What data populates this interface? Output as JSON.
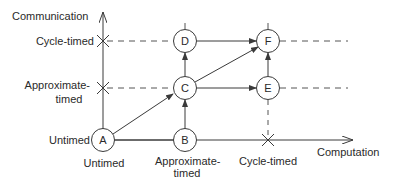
{
  "diagram": {
    "y_axis_label": "Communication",
    "x_axis_label": "Computation",
    "y_levels": [
      {
        "id": "untimed",
        "label": "Untimed"
      },
      {
        "id": "approximate",
        "label_line1": "Approximate-",
        "label_line2": "timed"
      },
      {
        "id": "cycle",
        "label": "Cycle-timed"
      }
    ],
    "x_levels": [
      {
        "id": "untimed",
        "label": "Untimed"
      },
      {
        "id": "approximate",
        "label_line1": "Approximate-",
        "label_line2": "timed"
      },
      {
        "id": "cycle",
        "label": "Cycle-timed"
      }
    ],
    "nodes": [
      {
        "id": "A",
        "label": "A",
        "computation": "Untimed",
        "communication": "Untimed"
      },
      {
        "id": "B",
        "label": "B",
        "computation": "Approximate-timed",
        "communication": "Untimed"
      },
      {
        "id": "C",
        "label": "C",
        "computation": "Approximate-timed",
        "communication": "Approximate-timed"
      },
      {
        "id": "D",
        "label": "D",
        "computation": "Approximate-timed",
        "communication": "Cycle-timed"
      },
      {
        "id": "E",
        "label": "E",
        "computation": "Cycle-timed",
        "communication": "Approximate-timed"
      },
      {
        "id": "F",
        "label": "F",
        "computation": "Cycle-timed",
        "communication": "Cycle-timed"
      }
    ],
    "edges": [
      {
        "from": "A",
        "to": "C",
        "style": "arrow"
      },
      {
        "from": "A",
        "to": "B",
        "style": "line"
      },
      {
        "from": "B",
        "to": "C",
        "style": "arrow"
      },
      {
        "from": "C",
        "to": "D",
        "style": "arrow"
      },
      {
        "from": "C",
        "to": "E",
        "style": "arrow"
      },
      {
        "from": "C",
        "to": "F",
        "style": "arrow"
      },
      {
        "from": "D",
        "to": "F",
        "style": "arrow"
      },
      {
        "from": "E",
        "to": "F",
        "style": "arrow"
      }
    ],
    "colors": {
      "stroke": "#3a3a3a",
      "text": "#2a2a2a",
      "background": "#ffffff"
    }
  }
}
